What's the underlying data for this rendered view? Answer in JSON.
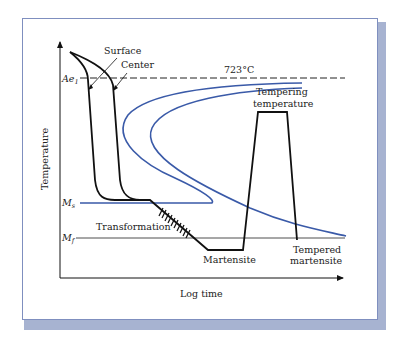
{
  "figure": {
    "y_axis_label": "Temperature",
    "x_axis_label": "Log time",
    "ae1": {
      "symbol": "Ae",
      "subscript": "1",
      "value_label": "723°C"
    },
    "ms": {
      "symbol": "M",
      "subscript": "s"
    },
    "mf": {
      "symbol": "M",
      "subscript": "f"
    },
    "curve_labels": {
      "surface": "Surface",
      "center": "Center"
    },
    "region_labels": {
      "transformation": "Transformation",
      "martensite": "Martensite",
      "tempering_line1": "Tempering",
      "tempering_line2": "temperature",
      "tempered_line1": "Tempered",
      "tempered_line2": "martensite"
    },
    "colors": {
      "cooling_curve": "#111111",
      "ttt_curve": "#3a5aa8",
      "frame_shadow": "#a7b3d1",
      "frame_border": "#7f8fbf"
    }
  }
}
